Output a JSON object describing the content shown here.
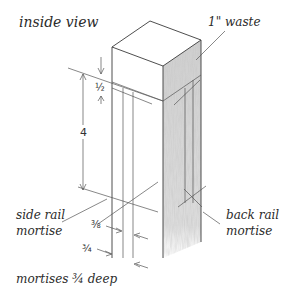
{
  "title": "inside view",
  "labels": {
    "waste": "1\" waste",
    "side_rail_line1": "side rail",
    "side_rail_line2": "mortise",
    "back_rail_line1": "back rail",
    "back_rail_line2": "mortise",
    "depth_note": "mortises ¾ deep"
  },
  "dimensions": {
    "top_offset": "½",
    "mortise_length": "4",
    "mortise_width": "⅜",
    "mortise_offset": "¾"
  },
  "colors": {
    "line": "#3a3a3a",
    "shaded_face": "#d6d6d6",
    "background": "#ffffff"
  }
}
